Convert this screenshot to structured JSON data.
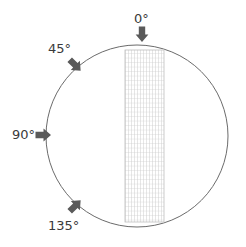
{
  "figure": {
    "type": "diagram",
    "background_color": "#ffffff",
    "circle": {
      "name": "field-of-view-circle",
      "center_x": 137,
      "center_y": 136,
      "radius": 91,
      "stroke_color": "#6b6b6b",
      "stroke_width": 1,
      "fill": "none"
    },
    "grid_region": {
      "name": "grid-rectangle",
      "x": 125,
      "y": 50,
      "width": 39,
      "height": 172,
      "stroke_color": "#c9c9c9",
      "border_color": "#bdbdbd",
      "fill": "#ffffff",
      "vertical_line_spacing": 3,
      "horizontal_line_spacing": 4.5,
      "vertical_line_count": 14,
      "horizontal_line_count": 39,
      "corner_mark": "."
    },
    "arrow_color": "#5a5a5a",
    "markers": [
      {
        "id": "marker-0",
        "label": "0°",
        "angle_deg": 0,
        "arrow_direction": "down",
        "arrow_rotation_deg": 0,
        "label_x": 134,
        "label_y": 12,
        "arrow_x": 142,
        "arrow_y": 34
      },
      {
        "id": "marker-45",
        "label": "45°",
        "angle_deg": 45,
        "arrow_direction": "down-right",
        "arrow_rotation_deg": 45,
        "label_x": 48,
        "label_y": 42,
        "arrow_x": 75,
        "arrow_y": 65
      },
      {
        "id": "marker-90",
        "label": "90°",
        "angle_deg": 90,
        "arrow_direction": "right",
        "arrow_rotation_deg": 90,
        "label_x": 12,
        "label_y": 128,
        "arrow_x": 43,
        "arrow_y": 135
      },
      {
        "id": "marker-135",
        "label": "135°",
        "angle_deg": 135,
        "arrow_direction": "up-right",
        "arrow_rotation_deg": 135,
        "label_x": 48,
        "label_y": 219,
        "arrow_x": 75,
        "arrow_y": 206
      }
    ]
  }
}
